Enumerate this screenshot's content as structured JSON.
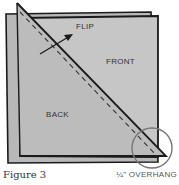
{
  "figure": {
    "caption": "Figure 3",
    "note": "¼\" OVERHANG",
    "labels": {
      "flip": "FLIP",
      "front": "FRONT",
      "back": "BACK"
    },
    "colors": {
      "fabric_back": "#b8b8b8",
      "fabric_front": "#c4c4c4",
      "fold_triangle": "#bdbdbd",
      "outline": "#1a1a1a",
      "circle": "#777777"
    }
  }
}
